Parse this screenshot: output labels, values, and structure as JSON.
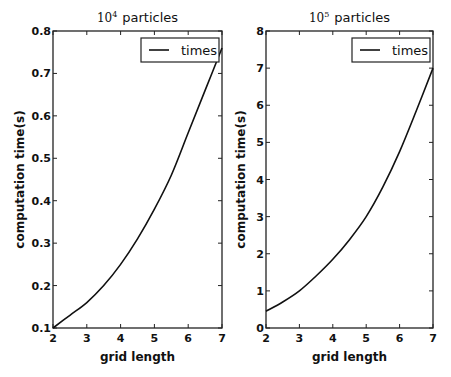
{
  "chart_data": [
    {
      "type": "line",
      "title": "10^4 particles",
      "title_base": "10",
      "title_exp": "4",
      "title_suffix": "particles",
      "xlabel": "grid length",
      "ylabel": "computation time(s)",
      "xlim": [
        2,
        7
      ],
      "ylim": [
        0.1,
        0.8
      ],
      "xticks": [
        "2",
        "3",
        "4",
        "5",
        "6",
        "7"
      ],
      "yticks": [
        "0.1",
        "0.2",
        "0.3",
        "0.4",
        "0.5",
        "0.6",
        "0.7",
        "0.8"
      ],
      "grid": false,
      "legend_position": "upper right",
      "series": [
        {
          "name": "times",
          "x": [
            2,
            2.5,
            3,
            3.5,
            4,
            4.5,
            5,
            5.5,
            6,
            6.5,
            7
          ],
          "y": [
            0.1,
            0.13,
            0.16,
            0.2,
            0.25,
            0.31,
            0.38,
            0.46,
            0.56,
            0.66,
            0.76
          ]
        }
      ]
    },
    {
      "type": "line",
      "title": "10^5 particles",
      "title_base": "10",
      "title_exp": "5",
      "title_suffix": "particles",
      "xlabel": "grid length",
      "ylabel": "computation time(s)",
      "xlim": [
        2,
        7
      ],
      "ylim": [
        0,
        8
      ],
      "xticks": [
        "2",
        "3",
        "4",
        "5",
        "6",
        "7"
      ],
      "yticks": [
        "0",
        "1",
        "2",
        "3",
        "4",
        "5",
        "6",
        "7",
        "8"
      ],
      "grid": false,
      "legend_position": "upper right",
      "series": [
        {
          "name": "times",
          "x": [
            2,
            2.5,
            3,
            3.5,
            4,
            4.5,
            5,
            5.5,
            6,
            6.5,
            7
          ],
          "y": [
            0.45,
            0.7,
            1.0,
            1.4,
            1.85,
            2.38,
            3.0,
            3.8,
            4.75,
            5.85,
            7.0
          ]
        }
      ]
    }
  ],
  "style": {
    "line_color": "#111111",
    "frame_color": "#222222",
    "background": "#ffffff"
  }
}
